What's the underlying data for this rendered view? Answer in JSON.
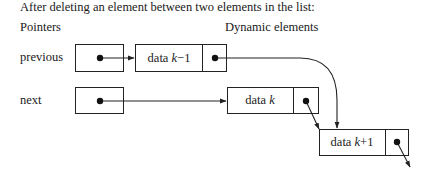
{
  "caption": "After deleting an element between two elements in the list:",
  "labels": {
    "pointers": "Pointers",
    "dynamic_elements": "Dynamic elements",
    "previous": "previous",
    "next": "next"
  },
  "nodes": [
    {
      "id": "k-1",
      "data_prefix": "data ",
      "data_var": "k",
      "data_suffix": "−1"
    },
    {
      "id": "k",
      "data_prefix": "data ",
      "data_var": "k",
      "data_suffix": ""
    },
    {
      "id": "k+1",
      "data_prefix": "data ",
      "data_var": "k",
      "data_suffix": "+1"
    }
  ],
  "colors": {
    "line": "#222222",
    "background": "#ffffff"
  }
}
